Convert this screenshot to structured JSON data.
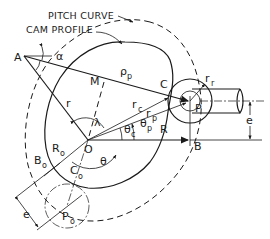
{
  "diagram": {
    "title_labels": {
      "pitch_curve": "PITCH CURVE",
      "cam_profile": "CAM PROFILE"
    },
    "points": {
      "A": "A",
      "M": "M",
      "C": "C",
      "P": "P",
      "O": "O",
      "B": "B",
      "B0": "B",
      "B0_sub": "o",
      "C0": "C",
      "C0_sub": "o",
      "P0": "P",
      "P0_sub": "o"
    },
    "symbols": {
      "alpha": "α",
      "lambda": "λ",
      "theta": "θ",
      "rho_p": "ρ",
      "rho_p_sub": "p",
      "r": "r",
      "r_c": "r",
      "r_c_sub": "c",
      "r_p": "r",
      "r_p_sub": "p",
      "r_r": "r",
      "r_r_sub": "r",
      "R": "R",
      "R0": "R",
      "R0_sub": "o",
      "theta_c": "θ",
      "theta_c_sub": "c",
      "theta_p": "θ",
      "theta_p_sub": "p",
      "e_top": "e",
      "e_bottom": "e"
    },
    "colors": {
      "ink": "#1a1a1a",
      "background": "#ffffff"
    }
  }
}
